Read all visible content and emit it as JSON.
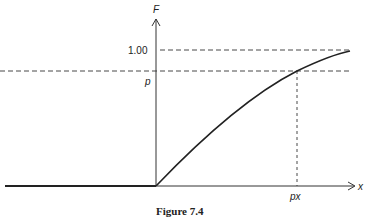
{
  "figure": {
    "caption": "Figure 7.4",
    "y_axis_label": "F",
    "x_axis_label": "x",
    "y_ticks": [
      {
        "label": "1.00",
        "value": 1.0
      },
      {
        "label": "p",
        "value": "p"
      }
    ],
    "x_ticks": [
      {
        "label": "px",
        "value": "p_x"
      }
    ]
  },
  "colors": {
    "line": "#222222",
    "background": "#ffffff"
  }
}
